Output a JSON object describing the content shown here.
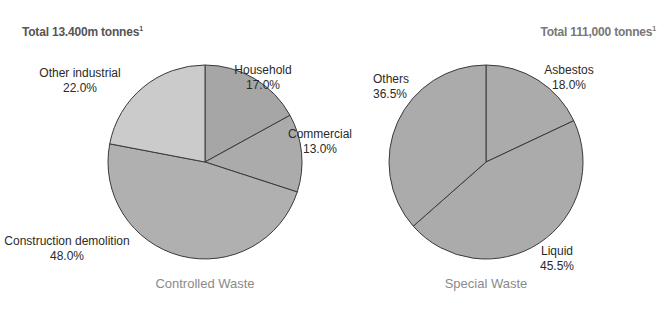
{
  "chart_data": [
    {
      "type": "pie",
      "title": "Controlled Waste",
      "total_label": "Total 13.400m tonnes",
      "footnote_marker": "1",
      "slices": [
        {
          "label": "Household",
          "value": 17.0,
          "value_label": "17.0%",
          "color": "#a6a6a6"
        },
        {
          "label": "Commercial",
          "value": 13.0,
          "value_label": "13.0%",
          "color": "#ababab"
        },
        {
          "label": "Construction demolition",
          "value": 48.0,
          "value_label": "48.0%",
          "color": "#b0b0b0"
        },
        {
          "label": "Other industrial",
          "value": 22.0,
          "value_label": "22.0%",
          "color": "#cbcbcb"
        }
      ]
    },
    {
      "type": "pie",
      "title": "Special Waste",
      "total_label": "Total 111,000 tonnes",
      "footnote_marker": "1",
      "slices": [
        {
          "label": "Asbestos",
          "value": 18.0,
          "value_label": "18.0%",
          "color": "#ababab"
        },
        {
          "label": "Liquid",
          "value": 45.5,
          "value_label": "45.5%",
          "color": "#ababab"
        },
        {
          "label": "Others",
          "value": 36.5,
          "value_label": "36.5%",
          "color": "#ababab"
        }
      ]
    }
  ]
}
